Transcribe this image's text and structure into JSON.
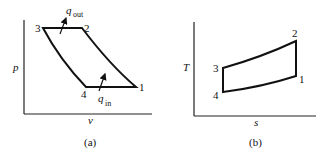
{
  "diagram_a": {
    "caption": "(a)",
    "xlabel": "v",
    "ylabel": "p",
    "points": {
      "p1": "1",
      "p2": "2",
      "p3": "3",
      "p4": "4"
    },
    "q_out": "q",
    "q_out_sub": "out",
    "q_in": "q",
    "q_in_sub": "in"
  },
  "diagram_b": {
    "caption": "(b)",
    "xlabel": "s",
    "ylabel": "T",
    "points": {
      "p1": "1",
      "p2": "2",
      "p3": "3",
      "p4": "4"
    }
  }
}
